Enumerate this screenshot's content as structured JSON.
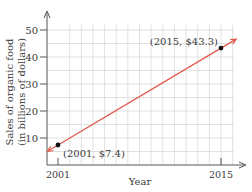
{
  "chart_data": {
    "type": "line",
    "title": "",
    "xlabel": "Year",
    "ylabel_line1": "Sales of organic food",
    "ylabel_line2": "(in billions of dollars)",
    "x_ticks": [
      {
        "value": 2001,
        "label": "2001"
      },
      {
        "value": 2015,
        "label": "2015"
      }
    ],
    "y_ticks": [
      {
        "value": 10,
        "label": "10"
      },
      {
        "value": 20,
        "label": "20"
      },
      {
        "value": 30,
        "label": "30"
      },
      {
        "value": 40,
        "label": "40"
      },
      {
        "value": 50,
        "label": "50"
      }
    ],
    "xlim": [
      2000,
      2017
    ],
    "ylim": [
      0,
      52
    ],
    "grid": true,
    "series": [
      {
        "name": "Sales of organic food",
        "points": [
          {
            "x": 2001,
            "y": 7.4,
            "label": "(2001, $7.4)"
          },
          {
            "x": 2015,
            "y": 43.3,
            "label": "(2015, $43.3)"
          }
        ],
        "color": "#e2584a"
      }
    ],
    "colors": {
      "line": "#e2584a",
      "grid": "#d9d9d9",
      "axis": "#555555",
      "point": "#111111"
    }
  }
}
